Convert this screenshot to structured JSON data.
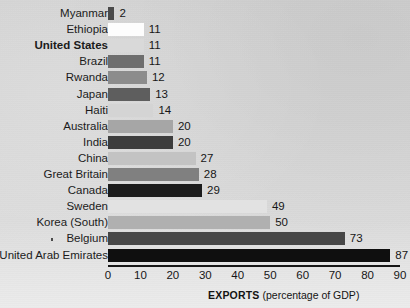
{
  "chart_data": {
    "type": "bar",
    "orientation": "horizontal",
    "title": "",
    "subtitle": "",
    "xlabel": "EXPORTS (percentage of GDP)",
    "ylabel": "",
    "xlim": [
      0,
      90
    ],
    "grid": false,
    "legend": null,
    "x_ticks": [
      0,
      10,
      20,
      30,
      40,
      50,
      60,
      70,
      80,
      90
    ],
    "categories": [
      "Myanmar",
      "Ethiopia",
      "United States",
      "Brazil",
      "Rwanda",
      "Japan",
      "Haiti",
      "Australia",
      "India",
      "China",
      "Great Britain",
      "Canada",
      "Sweden",
      "Korea (South)",
      "Belgium",
      "United Arab Emirates"
    ],
    "values": [
      2,
      11,
      11,
      11,
      12,
      13,
      14,
      20,
      20,
      27,
      28,
      29,
      49,
      50,
      73,
      87
    ],
    "value_labels": [
      "2",
      "11",
      "11",
      "11",
      "12",
      "13",
      "14",
      "20",
      "20",
      "27",
      "28",
      "29",
      "49",
      "50",
      "73",
      "87"
    ],
    "bar_colors": [
      "#4a4a4a",
      "#fdfdfd",
      "#d9d9d9",
      "#6e6e6e",
      "#8c8c8c",
      "#5e5e5e",
      "#d4d4d4",
      "#a6a6a6",
      "#3d3d3d",
      "#c3c3c3",
      "#808080",
      "#1c1c1c",
      "#e2e2e2",
      "#b0b0b0",
      "#474747",
      "#0f0f0f"
    ],
    "emphasized_category": "United States"
  },
  "axis": {
    "caption_strong": "EXPORTS",
    "caption_rest": " (percentage of GDP)"
  },
  "colors": {
    "background": "#d8d8d8",
    "axis": "#161616",
    "text": "#161616"
  }
}
